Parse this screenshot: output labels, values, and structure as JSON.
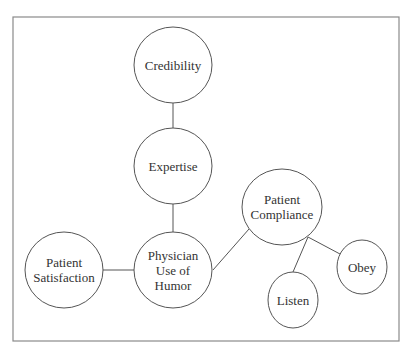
{
  "diagram": {
    "type": "concept-map",
    "frame": {
      "x": 13,
      "y": 17,
      "width": 386,
      "height": 324
    },
    "nodes": [
      {
        "id": "credibility",
        "lines": [
          "Credibility"
        ],
        "cx": 173,
        "cy": 65,
        "rx": 39,
        "ry": 38
      },
      {
        "id": "expertise",
        "lines": [
          "Expertise"
        ],
        "cx": 173,
        "cy": 166,
        "rx": 39,
        "ry": 38
      },
      {
        "id": "physician_humor",
        "lines": [
          "Physician",
          "Use of",
          "Humor"
        ],
        "cx": 173,
        "cy": 270,
        "rx": 39,
        "ry": 38
      },
      {
        "id": "patient_satisfaction",
        "lines": [
          "Patient",
          "Satisfaction"
        ],
        "cx": 64,
        "cy": 270,
        "rx": 39,
        "ry": 38
      },
      {
        "id": "patient_compliance",
        "lines": [
          "Patient",
          "Compliance"
        ],
        "cx": 282,
        "cy": 207,
        "rx": 40,
        "ry": 38
      },
      {
        "id": "listen",
        "lines": [
          "Listen"
        ],
        "cx": 293,
        "cy": 300,
        "rx": 25,
        "ry": 28
      },
      {
        "id": "obey",
        "lines": [
          "Obey"
        ],
        "cx": 362,
        "cy": 267,
        "rx": 25,
        "ry": 27
      }
    ],
    "edges": [
      {
        "from": "credibility",
        "to": "expertise",
        "x1": 173,
        "y1": 103,
        "x2": 173,
        "y2": 128
      },
      {
        "from": "expertise",
        "to": "physician_humor",
        "x1": 173,
        "y1": 204,
        "x2": 173,
        "y2": 232
      },
      {
        "from": "patient_satisfaction",
        "to": "physician_humor",
        "x1": 103,
        "y1": 270,
        "x2": 134,
        "y2": 270
      },
      {
        "from": "physician_humor",
        "to": "patient_compliance",
        "x1": 213,
        "y1": 270,
        "x2": 249,
        "y2": 229
      },
      {
        "from": "patient_compliance",
        "to": "listen",
        "x1": 308,
        "y1": 237,
        "x2": 293,
        "y2": 272
      },
      {
        "from": "patient_compliance",
        "to": "obey",
        "x1": 308,
        "y1": 237,
        "x2": 340,
        "y2": 254
      }
    ]
  }
}
